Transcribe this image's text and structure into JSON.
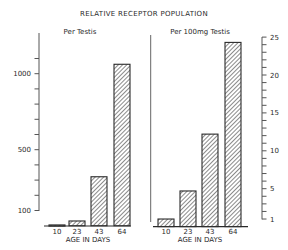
{
  "chart_data": [
    {
      "type": "bar",
      "title": "RELATIVE RECEPTOR POPULATION",
      "subtitle": "Per Testis",
      "xlabel": "AGE IN DAYS",
      "ylabel": "",
      "categories": [
        "10",
        "23",
        "43",
        "64"
      ],
      "values": [
        5,
        31,
        322,
        1062
      ],
      "ylim": [
        0,
        1150
      ],
      "yticks": [
        100,
        500,
        1000
      ],
      "minor_tick_step": 100,
      "axis_side": "left",
      "grid": false,
      "bar_fill": "diagonal-hatch"
    },
    {
      "type": "bar",
      "title": "RELATIVE RECEPTOR POPULATION",
      "subtitle": "Per 100mg Testis",
      "xlabel": "AGE IN DAYS",
      "ylabel": "",
      "categories": [
        "10",
        "23",
        "43",
        "64"
      ],
      "values": [
        1.0,
        4.7,
        12.2,
        24.3
      ],
      "ylim": [
        0,
        25
      ],
      "yticks": [
        1,
        5,
        10,
        15,
        20,
        25
      ],
      "minor_tick_step": 1,
      "axis_side": "right",
      "grid": false,
      "bar_fill": "diagonal-hatch"
    }
  ],
  "figure": {
    "title": "RELATIVE RECEPTOR POPULATION",
    "left_panel": {
      "subtitle": "Per Testis",
      "xlabel": "AGE IN DAYS",
      "tick_labels": [
        "100",
        "500",
        "1000"
      ],
      "categories": [
        "10",
        "23",
        "43",
        "64"
      ]
    },
    "right_panel": {
      "subtitle": "Per 100mg Testis",
      "xlabel": "AGE IN DAYS",
      "tick_labels": [
        "1",
        "5",
        "10",
        "15",
        "20",
        "25"
      ],
      "categories": [
        "10",
        "23",
        "43",
        "64"
      ]
    },
    "colors": {
      "ink": "#2a2a2a",
      "background": "#ffffff"
    }
  }
}
